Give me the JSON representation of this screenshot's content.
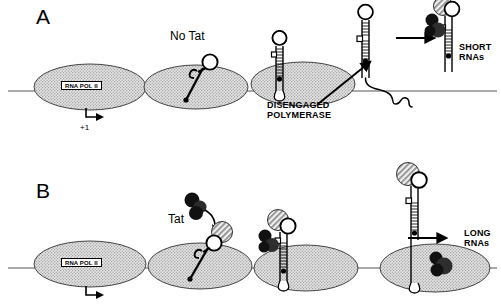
{
  "figure": {
    "width": 501,
    "height": 305,
    "background": "#ffffff"
  },
  "colors": {
    "ink": "#000000",
    "polymerase_fill": "#d8d8d8",
    "polymerase_stipple": "#8a8a8a",
    "tat_dark": "#1a1a1a",
    "tat_medium": "#3d3d3d",
    "cyclin_hatch": "#9a9a9a",
    "dna_line": "#4a4a4a",
    "paper": "#ffffff"
  },
  "panels": [
    {
      "id": "A",
      "letter": "A",
      "letter_pos": {
        "x": 36,
        "y": 6
      },
      "caption_summary": "Without Tat, RNA polymerase II disengages and produces short RNAs",
      "labels": [
        {
          "name": "no-tat-label",
          "text": "No Tat",
          "x": 170,
          "y": 30,
          "style": "lbl-no-tat"
        },
        {
          "name": "disengaged-polymerase-label",
          "text": "DISENGAGED\nPOLYMERASE",
          "x": 267,
          "y": 100,
          "style": "lbl-bold"
        },
        {
          "name": "short-rnas-label",
          "text": "SHORT\nRNAs",
          "x": 459,
          "y": 42,
          "style": "lbl-bold"
        },
        {
          "name": "start-site-label",
          "text": "+1",
          "x": 80,
          "y": 124,
          "style": "lbl-plus1"
        }
      ],
      "polymerases": [
        {
          "name": "polymerase-initiating",
          "cx": 90,
          "cy": 87,
          "rx": 56,
          "ry": 23,
          "label": "RNA POL II",
          "label_pos": {
            "x": 61,
            "y": 81
          }
        },
        {
          "name": "polymerase-paused",
          "cx": 196,
          "cy": 87,
          "rx": 52,
          "ry": 22
        },
        {
          "name": "polymerase-disengaged",
          "cx": 303,
          "cy": 84,
          "rx": 52,
          "ry": 22
        }
      ],
      "hairpins": [
        {
          "name": "tar-hairpin-nascent",
          "type": "short-stem-loop",
          "has_tat": false
        },
        {
          "name": "tar-hairpin-disengaged",
          "type": "ladder-stem-loop",
          "has_tat": false
        },
        {
          "name": "tar-hairpin-free",
          "type": "ladder-stem-loop-with-tail",
          "has_tat": false
        },
        {
          "name": "tar-hairpin-tat-bound",
          "type": "ladder-stem-loop",
          "has_tat": true
        }
      ],
      "arrows": [
        {
          "name": "release-arrow",
          "kind": "diagonal",
          "from": [
            318,
            103
          ],
          "to": [
            372,
            62
          ]
        },
        {
          "name": "short-rna-arrow",
          "kind": "horizontal",
          "from": [
            396,
            38
          ],
          "to": [
            436,
            38
          ]
        }
      ]
    },
    {
      "id": "B",
      "letter": "B",
      "letter_pos": {
        "x": 36,
        "y": 180
      },
      "caption_summary": "With Tat bound to TAR, polymerase remains engaged and makes long RNAs",
      "labels": [
        {
          "name": "tat-label",
          "text": "Tat",
          "x": 168,
          "y": 213,
          "style": "lbl-tat"
        },
        {
          "name": "long-rnas-label",
          "text": "LONG\nRNAs",
          "x": 464,
          "y": 228,
          "style": "lbl-bold"
        }
      ],
      "polymerases": [
        {
          "name": "polymerase-initiating-b",
          "cx": 90,
          "cy": 264,
          "rx": 56,
          "ry": 23,
          "label": "RNA POL II",
          "label_pos": {
            "x": 61,
            "y": 258
          }
        },
        {
          "name": "polymerase-tat-recruited",
          "cx": 200,
          "cy": 266,
          "rx": 52,
          "ry": 23
        },
        {
          "name": "polymerase-tat-engaged",
          "cx": 306,
          "cy": 268,
          "rx": 52,
          "ry": 23
        },
        {
          "name": "polymerase-elongating",
          "cx": 435,
          "cy": 268,
          "rx": 55,
          "ry": 24
        }
      ],
      "hairpins": [
        {
          "name": "tar-hairpin-b1",
          "type": "short-stem-loop",
          "has_tat": false,
          "has_cyclin": true
        },
        {
          "name": "tar-hairpin-b2",
          "type": "ladder-stem-loop",
          "has_tat": true,
          "has_cyclin": true
        },
        {
          "name": "tar-hairpin-b3",
          "type": "tall-ladder-stem-loop",
          "has_tat": false,
          "has_cyclin": true
        }
      ],
      "arrows": [
        {
          "name": "tat-binding-arrow",
          "kind": "curved",
          "from": [
            198,
            206
          ],
          "to": [
            214,
            232
          ]
        },
        {
          "name": "long-rna-arrow",
          "kind": "horizontal",
          "from": [
            408,
            238
          ],
          "to": [
            448,
            238
          ]
        },
        {
          "name": "start-site-arrow-b",
          "kind": "corner",
          "x": 88,
          "y": 290
        }
      ]
    }
  ],
  "legend": {
    "polymerase_name": "RNA POL II",
    "factor_name": "Tat",
    "products": [
      "SHORT RNAs",
      "LONG RNAs"
    ],
    "state_disengaged": "DISENGAGED POLYMERASE",
    "start_site": "+1"
  }
}
